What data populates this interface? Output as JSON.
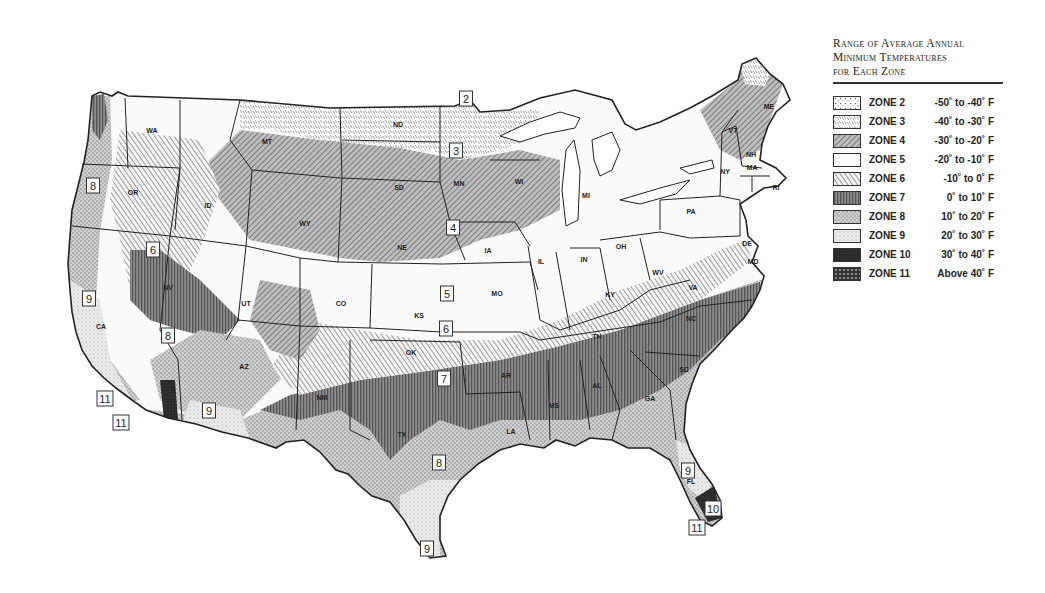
{
  "legend": {
    "title_lines": [
      "Range of Average Annual",
      "Minimum Temperatures",
      "for Each Zone"
    ],
    "zones": [
      {
        "zone": "ZONE 2",
        "range": "-50˚ to -40˚ F",
        "pattern": "z2"
      },
      {
        "zone": "ZONE 3",
        "range": "-40˚ to -30˚ F",
        "pattern": "z3"
      },
      {
        "zone": "ZONE 4",
        "range": "-30˚ to -20˚ F",
        "pattern": "z4"
      },
      {
        "zone": "ZONE 5",
        "range": "-20˚ to -10˚ F",
        "pattern": "z5"
      },
      {
        "zone": "ZONE 6",
        "range": "-10˚ to 0˚ F",
        "pattern": "z6"
      },
      {
        "zone": "ZONE 7",
        "range": "0˚ to 10˚ F",
        "pattern": "z7"
      },
      {
        "zone": "ZONE 8",
        "range": "10˚ to 20˚ F",
        "pattern": "z8"
      },
      {
        "zone": "ZONE 9",
        "range": "20˚ to 30˚ F",
        "pattern": "z9"
      },
      {
        "zone": "ZONE 10",
        "range": "30˚ to 40˚ F",
        "pattern": "z10"
      },
      {
        "zone": "ZONE 11",
        "range": "Above 40˚ F",
        "pattern": "z11"
      }
    ]
  },
  "map": {
    "state_labels": [
      {
        "abbr": "WA",
        "x": 152,
        "y": 133
      },
      {
        "abbr": "OR",
        "x": 133,
        "y": 195
      },
      {
        "abbr": "ID",
        "x": 208,
        "y": 208
      },
      {
        "abbr": "MT",
        "x": 267,
        "y": 144
      },
      {
        "abbr": "WY",
        "x": 305,
        "y": 226
      },
      {
        "abbr": "NV",
        "x": 168,
        "y": 290
      },
      {
        "abbr": "UT",
        "x": 246,
        "y": 306
      },
      {
        "abbr": "CO",
        "x": 341,
        "y": 306
      },
      {
        "abbr": "CA",
        "x": 101,
        "y": 329
      },
      {
        "abbr": "AZ",
        "x": 244,
        "y": 369
      },
      {
        "abbr": "NM",
        "x": 322,
        "y": 400
      },
      {
        "abbr": "ND",
        "x": 398,
        "y": 127
      },
      {
        "abbr": "SD",
        "x": 399,
        "y": 190
      },
      {
        "abbr": "NE",
        "x": 402,
        "y": 250
      },
      {
        "abbr": "KS",
        "x": 419,
        "y": 318
      },
      {
        "abbr": "OK",
        "x": 411,
        "y": 355
      },
      {
        "abbr": "TX",
        "x": 402,
        "y": 437
      },
      {
        "abbr": "MN",
        "x": 459,
        "y": 186
      },
      {
        "abbr": "IA",
        "x": 488,
        "y": 253
      },
      {
        "abbr": "MO",
        "x": 497,
        "y": 296
      },
      {
        "abbr": "AR",
        "x": 506,
        "y": 378
      },
      {
        "abbr": "LA",
        "x": 511,
        "y": 434
      },
      {
        "abbr": "WI",
        "x": 519,
        "y": 184
      },
      {
        "abbr": "IL",
        "x": 541,
        "y": 264
      },
      {
        "abbr": "MI",
        "x": 586,
        "y": 198
      },
      {
        "abbr": "IN",
        "x": 584,
        "y": 262
      },
      {
        "abbr": "OH",
        "x": 621,
        "y": 249
      },
      {
        "abbr": "KY",
        "x": 610,
        "y": 297
      },
      {
        "abbr": "TN",
        "x": 597,
        "y": 339
      },
      {
        "abbr": "MS",
        "x": 554,
        "y": 408
      },
      {
        "abbr": "AL",
        "x": 597,
        "y": 388
      },
      {
        "abbr": "GA",
        "x": 650,
        "y": 401
      },
      {
        "abbr": "FL",
        "x": 691,
        "y": 484
      },
      {
        "abbr": "SC",
        "x": 684,
        "y": 372
      },
      {
        "abbr": "NC",
        "x": 691,
        "y": 321
      },
      {
        "abbr": "VA",
        "x": 693,
        "y": 290
      },
      {
        "abbr": "WV",
        "x": 658,
        "y": 275
      },
      {
        "abbr": "PA",
        "x": 691,
        "y": 214
      },
      {
        "abbr": "NY",
        "x": 725,
        "y": 174
      },
      {
        "abbr": "VT",
        "x": 733,
        "y": 133
      },
      {
        "abbr": "NH",
        "x": 751,
        "y": 157
      },
      {
        "abbr": "MA",
        "x": 752,
        "y": 170
      },
      {
        "abbr": "ME",
        "x": 769,
        "y": 109
      },
      {
        "abbr": "RI",
        "x": 776,
        "y": 190
      },
      {
        "abbr": "DE",
        "x": 747,
        "y": 246
      },
      {
        "abbr": "MD",
        "x": 753,
        "y": 264
      }
    ],
    "zone_tags": [
      {
        "label": "2",
        "x": 466,
        "y": 99
      },
      {
        "label": "3",
        "x": 456,
        "y": 151
      },
      {
        "label": "4",
        "x": 453,
        "y": 228
      },
      {
        "label": "5",
        "x": 447,
        "y": 294
      },
      {
        "label": "6",
        "x": 446,
        "y": 329
      },
      {
        "label": "7",
        "x": 444,
        "y": 379
      },
      {
        "label": "8",
        "x": 439,
        "y": 463
      },
      {
        "label": "9",
        "x": 427,
        "y": 549
      },
      {
        "label": "8",
        "x": 93,
        "y": 186
      },
      {
        "label": "6",
        "x": 153,
        "y": 250
      },
      {
        "label": "9",
        "x": 89,
        "y": 299
      },
      {
        "label": "8",
        "x": 168,
        "y": 336
      },
      {
        "label": "9",
        "x": 209,
        "y": 411
      },
      {
        "label": "11",
        "x": 105,
        "y": 399
      },
      {
        "label": "11",
        "x": 121,
        "y": 423
      },
      {
        "label": "9",
        "x": 688,
        "y": 471
      },
      {
        "label": "10",
        "x": 713,
        "y": 509
      },
      {
        "label": "11",
        "x": 697,
        "y": 528
      }
    ]
  }
}
